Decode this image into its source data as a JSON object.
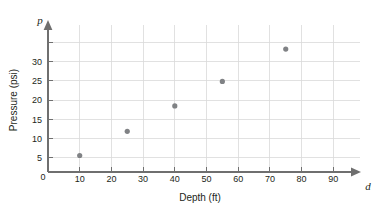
{
  "chart_data": {
    "type": "scatter",
    "title": "",
    "subtitle": "",
    "xlabel": "Depth (ft)",
    "ylabel": "Pressure (psi)",
    "x_variable": "d",
    "y_variable": "p",
    "xlim": [
      0,
      95
    ],
    "ylim": [
      0,
      34
    ],
    "x_ticks": [
      0,
      10,
      20,
      30,
      40,
      50,
      60,
      70,
      80,
      90
    ],
    "y_ticks": [
      0,
      5,
      10,
      15,
      20,
      25,
      30
    ],
    "x_tick_labels": [
      "0",
      "10",
      "20",
      "30",
      "40",
      "50",
      "60",
      "70",
      "80",
      "90"
    ],
    "y_tick_labels": [
      "0",
      "5",
      "10",
      "15",
      "20",
      "25",
      "30"
    ],
    "grid": true,
    "grid_x": true,
    "grid_y": true,
    "legend": false,
    "legend_position": "none",
    "point_color": "#808285",
    "grid_color": "#d9d9d9",
    "axis_color": "#6f6f6f",
    "text_color": "#231f20",
    "x": [
      10,
      25,
      40,
      55,
      75
    ],
    "values": [
      4.3,
      10.6,
      17.2,
      23.6,
      32.0
    ],
    "points": [
      {
        "d": 10,
        "p": 4.3
      },
      {
        "d": 25,
        "p": 10.6
      },
      {
        "d": 40,
        "p": 17.2
      },
      {
        "d": 55,
        "p": 23.6
      },
      {
        "d": 75,
        "p": 32.0
      }
    ],
    "annotations": []
  },
  "axes": {
    "x_axis_title": "Depth (ft)",
    "y_axis_title": "Pressure (psi)",
    "x_axis_variable": "d",
    "y_axis_variable": "p"
  }
}
